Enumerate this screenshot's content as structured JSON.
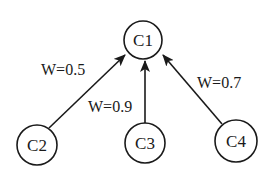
{
  "diagram": {
    "type": "directed-graph",
    "nodes": [
      {
        "id": "C1",
        "label": "C1",
        "cx": 143,
        "cy": 40,
        "r": 19
      },
      {
        "id": "C2",
        "label": "C2",
        "cx": 37,
        "cy": 145,
        "r": 20
      },
      {
        "id": "C3",
        "label": "C3",
        "cx": 145,
        "cy": 143,
        "r": 20
      },
      {
        "id": "C4",
        "label": "C4",
        "cx": 236,
        "cy": 141,
        "r": 21
      }
    ],
    "edges": [
      {
        "from": "C2",
        "to": "C1",
        "weight_label": "W=0.5",
        "weight": 0.5
      },
      {
        "from": "C3",
        "to": "C1",
        "weight_label": "W=0.9",
        "weight": 0.9
      },
      {
        "from": "C4",
        "to": "C1",
        "weight_label": "W=0.7",
        "weight": 0.7
      }
    ],
    "colors": {
      "stroke": "#1a1a1a",
      "background": "#ffffff"
    }
  }
}
